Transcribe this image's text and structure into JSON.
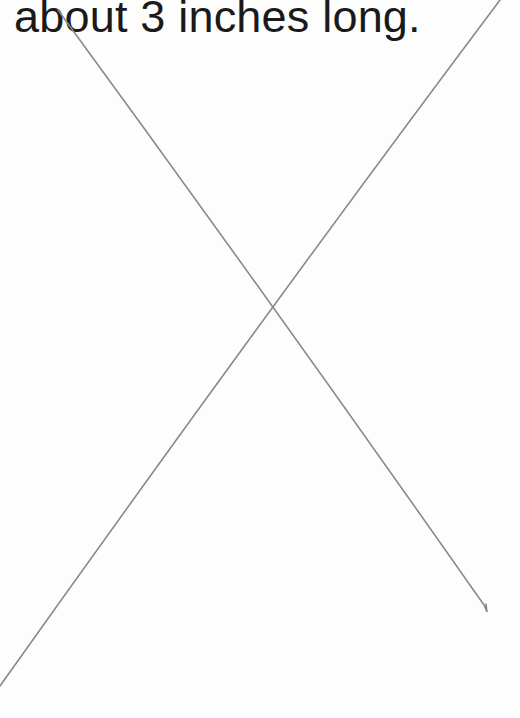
{
  "page": {
    "caption": "about 3 inches long.",
    "background": "#fdfdfd",
    "text_color": "#1a1a1a"
  },
  "marks": {
    "description": "two hand-drawn pencil lines crossing to form an X",
    "stroke_color": "#8a8a8a",
    "lines": [
      {
        "x1": 58,
        "y1": 10,
        "x2": 487,
        "y2": 612
      },
      {
        "x1": 500,
        "y1": 0,
        "x2": 0,
        "y2": 686
      }
    ],
    "intersection": {
      "x": 273,
      "y": 302
    }
  }
}
